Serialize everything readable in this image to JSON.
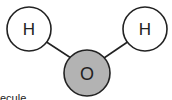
{
  "diagram": {
    "type": "molecule",
    "atoms": [
      {
        "label": "H",
        "fill": "#ffffff"
      },
      {
        "label": "H",
        "fill": "#ffffff"
      },
      {
        "label": "O",
        "fill": "#b3b3b3"
      }
    ],
    "bonds": [
      {
        "from": "H (left)",
        "to": "O"
      },
      {
        "from": "H (right)",
        "to": "O"
      }
    ],
    "caption_partial": "ecule"
  }
}
